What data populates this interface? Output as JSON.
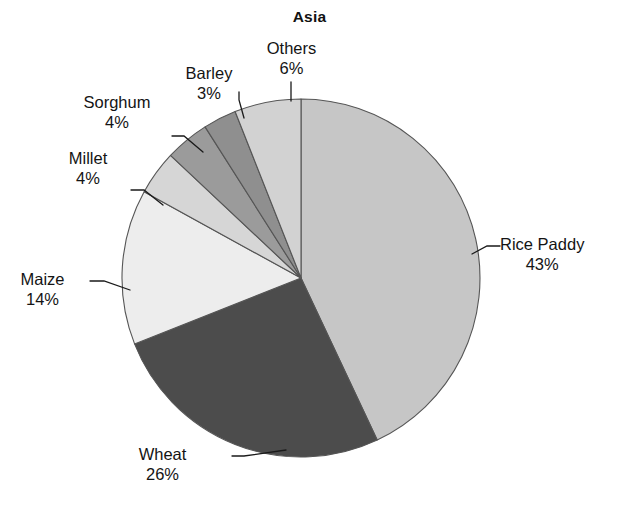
{
  "chart_data": {
    "type": "pie",
    "title": "Asia",
    "xlabel": "",
    "ylabel": "",
    "legend_position": "none",
    "grid": false,
    "units": "percent",
    "start_angle_deg": 0,
    "direction": "clockwise",
    "categories": [
      "Rice Paddy",
      "Wheat",
      "Maize",
      "Millet",
      "Sorghum",
      "Barley",
      "Others"
    ],
    "values": [
      43,
      26,
      14,
      4,
      4,
      3,
      6
    ],
    "labels": [
      "43%",
      "26%",
      "14%",
      "4%",
      "4%",
      "3%",
      "6%"
    ],
    "colors": [
      "#c6c6c6",
      "#4c4c4c",
      "#ededed",
      "#d6d6d6",
      "#9b9b9b",
      "#8f8f8f",
      "#d2d2d2"
    ],
    "slices": [
      {
        "name": "Rice Paddy",
        "value": 43,
        "label": "43%",
        "color": "#c6c6c6"
      },
      {
        "name": "Wheat",
        "value": 26,
        "label": "26%",
        "color": "#4c4c4c"
      },
      {
        "name": "Maize",
        "value": 14,
        "label": "14%",
        "color": "#ededed"
      },
      {
        "name": "Millet",
        "value": 4,
        "label": "4%",
        "color": "#d6d6d6"
      },
      {
        "name": "Sorghum",
        "value": 4,
        "label": "4%",
        "color": "#9b9b9b"
      },
      {
        "name": "Barley",
        "value": 3,
        "label": "3%",
        "color": "#8f8f8f"
      },
      {
        "name": "Others",
        "value": 6,
        "label": "6%",
        "color": "#d2d2d2"
      }
    ]
  },
  "chart": {
    "title": "Asia",
    "background": "#ffffff",
    "outline_color": "#555555",
    "text_color": "#141414"
  },
  "labels": {
    "rice_paddy": {
      "name": "Rice Paddy",
      "pct": "43%"
    },
    "wheat": {
      "name": "Wheat",
      "pct": "26%"
    },
    "maize": {
      "name": "Maize",
      "pct": "14%"
    },
    "millet": {
      "name": "Millet",
      "pct": "4%"
    },
    "sorghum": {
      "name": "Sorghum",
      "pct": "4%"
    },
    "barley": {
      "name": "Barley",
      "pct": "3%"
    },
    "others": {
      "name": "Others",
      "pct": "6%"
    }
  }
}
